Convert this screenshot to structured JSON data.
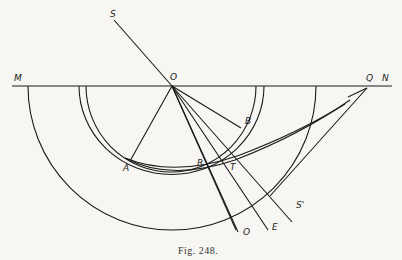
{
  "figure": {
    "caption": "Fig. 248.",
    "points": {
      "M": "M",
      "N": "N",
      "O_center": "O",
      "Q": "Q",
      "S": "S",
      "S_prime": "S'",
      "B": "B",
      "A": "A",
      "R": "R",
      "T": "T",
      "O_bottom": "O",
      "E": "E"
    },
    "colors": {
      "ink": "#1a1a1a",
      "paper": "#f7f6f3"
    }
  }
}
